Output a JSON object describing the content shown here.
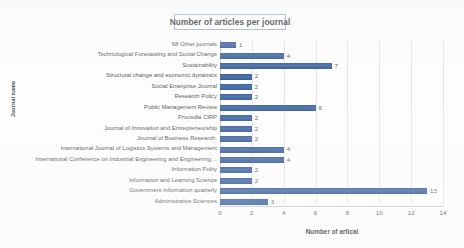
{
  "chart_data": {
    "type": "bar",
    "orientation": "horizontal",
    "title": "Number of articles per journal",
    "xlabel": "Number of artical",
    "ylabel": "Journal name",
    "xlim": [
      0,
      14
    ],
    "xticks": [
      0,
      2,
      4,
      6,
      8,
      10,
      12,
      14
    ],
    "grid": true,
    "legend": false,
    "bar_color": "#44679f",
    "categories": [
      "68 Other journals",
      "Technological Forecasting and Social Change",
      "Sustainability",
      "Structural change and economic dynamics",
      "Social Enterprise Journal",
      "Research Policy",
      "Public Management Review",
      "Procedia CIRP",
      "Journal of Innovation and Entrepreneurship",
      "Journal of Business Research.",
      "International Journal of Logistics Systems and Management",
      "International Conference on Industrial Engineering and Engineering…",
      "Information Polity",
      "Information and Learning Science",
      "Government information quarterly",
      "Administrative Sciences"
    ],
    "values": [
      1,
      4,
      7,
      2,
      2,
      2,
      6,
      2,
      2,
      2,
      4,
      4,
      2,
      2,
      13,
      3
    ],
    "value_labels": [
      "1",
      "4",
      "7",
      "2",
      "2",
      "2",
      "6",
      "2",
      "2",
      "2",
      "4",
      "4",
      "2",
      "2",
      "13",
      "3"
    ],
    "xtick_labels": [
      "0",
      "2",
      "4",
      "6",
      "8",
      "10",
      "12",
      "14"
    ]
  }
}
